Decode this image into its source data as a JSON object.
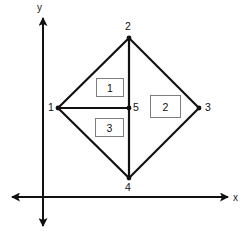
{
  "figure": {
    "background_color": "#ffffff",
    "line_color": "#111111",
    "box_border_color": "#7d7d7d",
    "axes": {
      "x_label": "x",
      "y_label": "y",
      "origin": {
        "x": 43,
        "y": 197
      },
      "x_axis": {
        "from_x": 12,
        "to_x": 228,
        "y": 197,
        "arrow_start": true,
        "arrow_end": true
      },
      "y_axis": {
        "x": 43,
        "from_y": 226,
        "to_y": 18,
        "arrow_start": true,
        "arrow_end": true
      }
    },
    "vertices": [
      {
        "id": "1",
        "label": "1",
        "x": 58,
        "y": 108,
        "label_x": 48,
        "label_y": 102,
        "marker": true
      },
      {
        "id": "2",
        "label": "2",
        "x": 129,
        "y": 38,
        "label_x": 125,
        "label_y": 21,
        "marker": true
      },
      {
        "id": "3",
        "label": "3",
        "x": 199,
        "y": 108,
        "label_x": 205,
        "label_y": 102,
        "marker": true
      },
      {
        "id": "4",
        "label": "4",
        "x": 129,
        "y": 178,
        "label_x": 125,
        "label_y": 182,
        "marker": true
      },
      {
        "id": "5",
        "label": "5",
        "x": 129,
        "y": 108,
        "label_x": 133,
        "label_y": 102,
        "marker": true
      }
    ],
    "edges": [
      {
        "name": "edge-1-2",
        "from": "1",
        "to": "2"
      },
      {
        "name": "edge-2-3",
        "from": "2",
        "to": "3"
      },
      {
        "name": "edge-3-4",
        "from": "3",
        "to": "4"
      },
      {
        "name": "edge-4-1",
        "from": "4",
        "to": "1"
      },
      {
        "name": "edge-2-5-4",
        "from": "2",
        "to": "4"
      },
      {
        "name": "edge-1-5",
        "from": "1",
        "to": "5"
      }
    ],
    "regions": [
      {
        "id": "region-1",
        "label": "1",
        "x": 96,
        "y": 78,
        "width": 28,
        "height": 19
      },
      {
        "id": "region-2",
        "label": "2",
        "x": 150,
        "y": 95,
        "width": 31,
        "height": 23
      },
      {
        "id": "region-3",
        "label": "3",
        "x": 95,
        "y": 118,
        "width": 29,
        "height": 19
      }
    ]
  }
}
